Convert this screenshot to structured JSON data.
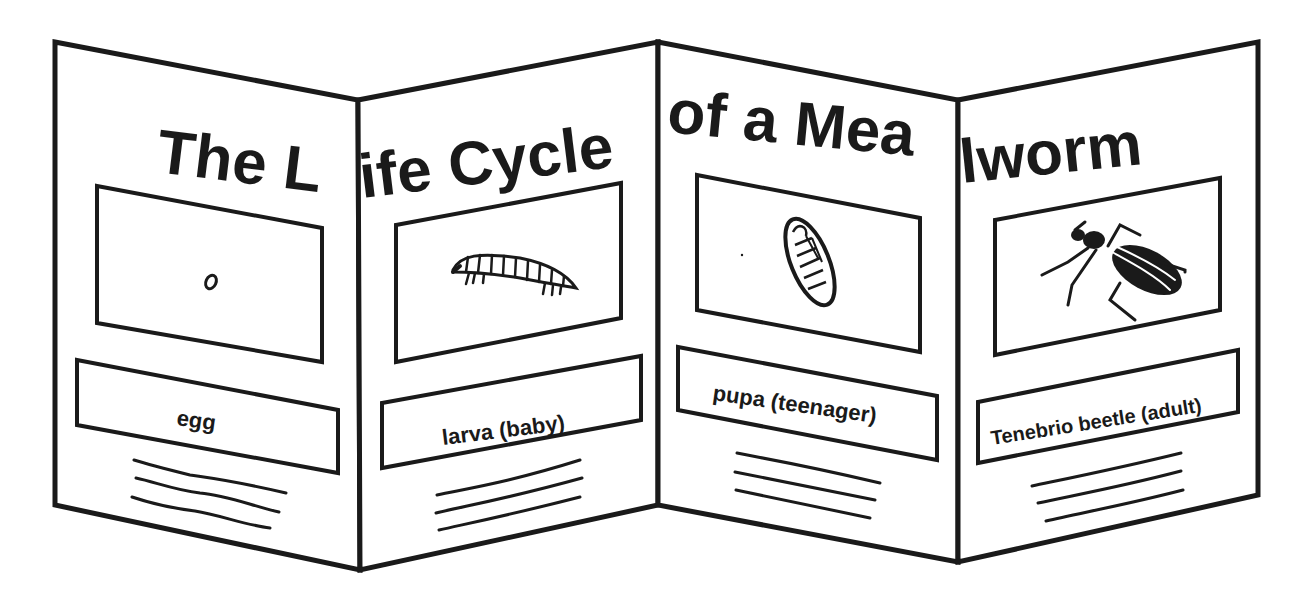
{
  "title": {
    "part1": "The L",
    "part2": "ife Cycle",
    "part3": "of a Mea",
    "part4": "lworm",
    "full": "The Life Cycle of a Mealworm"
  },
  "panels": [
    {
      "stage": "egg",
      "label": "egg",
      "icon": "egg-icon"
    },
    {
      "stage": "larva",
      "label": "larva (baby)",
      "icon": "larva-icon"
    },
    {
      "stage": "pupa",
      "label": "pupa (teenager)",
      "icon": "pupa-icon"
    },
    {
      "stage": "adult",
      "label": "Tenebrio beetle (adult)",
      "icon": "beetle-icon"
    }
  ],
  "colors": {
    "ink": "#1a1a1a",
    "paper": "#ffffff"
  }
}
